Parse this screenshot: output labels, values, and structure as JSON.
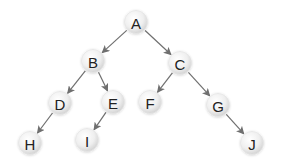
{
  "diagram": {
    "type": "binary-tree",
    "colors": {
      "background": "#ffffff",
      "node_fill_center": "#ffffff",
      "node_fill_edge": "#d2d2d2",
      "node_stroke": "#e6e6e6",
      "edge": "#6f6f6f",
      "label": "#222222"
    },
    "node_radius": 11.5,
    "nodes": [
      {
        "id": "A",
        "label": "A",
        "x": 136,
        "y": 22
      },
      {
        "id": "B",
        "label": "B",
        "x": 93,
        "y": 61
      },
      {
        "id": "C",
        "label": "C",
        "x": 180,
        "y": 63
      },
      {
        "id": "D",
        "label": "D",
        "x": 60,
        "y": 103
      },
      {
        "id": "E",
        "label": "E",
        "x": 113,
        "y": 102
      },
      {
        "id": "F",
        "label": "F",
        "x": 150,
        "y": 102
      },
      {
        "id": "G",
        "label": "G",
        "x": 218,
        "y": 105
      },
      {
        "id": "H",
        "label": "H",
        "x": 30,
        "y": 143
      },
      {
        "id": "I",
        "label": "I",
        "x": 87,
        "y": 140
      },
      {
        "id": "J",
        "label": "J",
        "x": 252,
        "y": 143
      }
    ],
    "edges": [
      {
        "from": "A",
        "to": "B"
      },
      {
        "from": "A",
        "to": "C"
      },
      {
        "from": "B",
        "to": "D"
      },
      {
        "from": "B",
        "to": "E"
      },
      {
        "from": "C",
        "to": "F"
      },
      {
        "from": "C",
        "to": "G"
      },
      {
        "from": "D",
        "to": "H"
      },
      {
        "from": "E",
        "to": "I"
      },
      {
        "from": "G",
        "to": "J"
      }
    ]
  }
}
